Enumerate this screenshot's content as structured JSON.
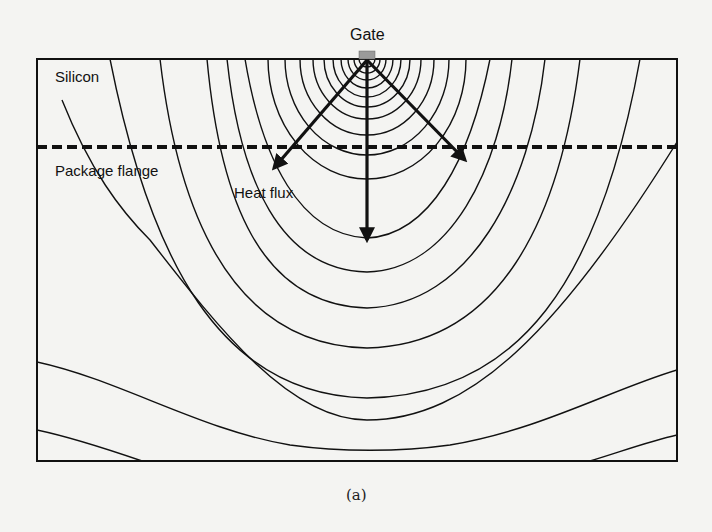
{
  "figure": {
    "caption": "(a)",
    "labels": {
      "gate": "Gate",
      "silicon": "Silicon",
      "flange": "Package flange",
      "heat_flux": "Heat flux"
    },
    "colors": {
      "line": "#111111",
      "gate_fill": "#9a9a9a",
      "background": "#f4f4f2"
    },
    "regions": [
      "Silicon",
      "Package flange"
    ],
    "boundary": "dashed line between silicon and package flange",
    "arrows": [
      "down-left heat flux",
      "down heat flux",
      "down-right heat flux"
    ]
  }
}
